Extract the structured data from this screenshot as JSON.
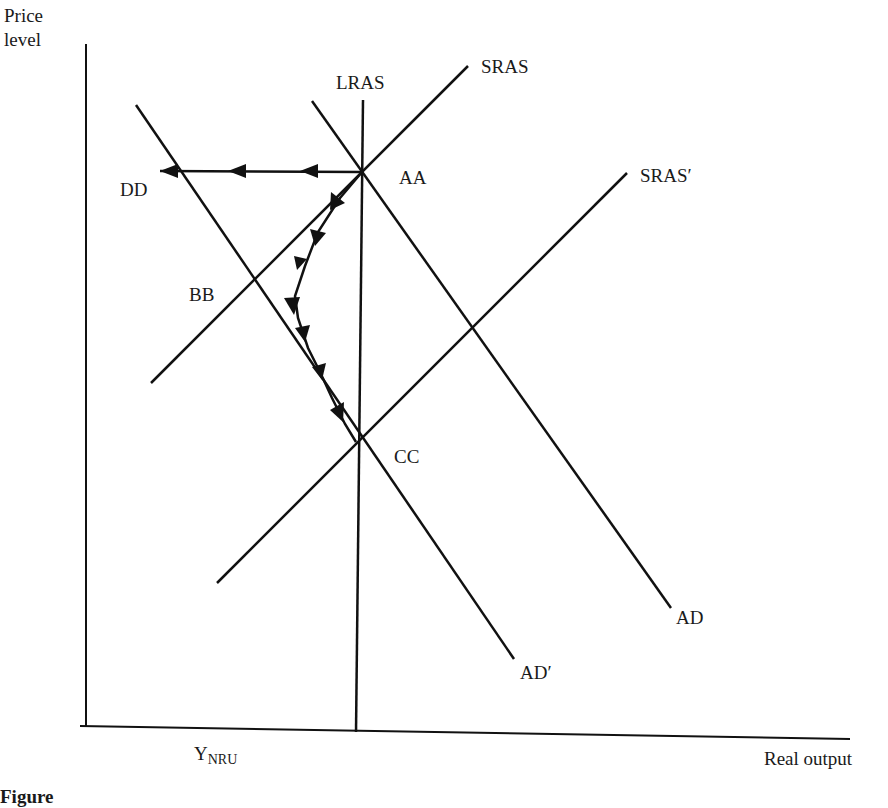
{
  "diagram": {
    "type": "AD-AS macroeconomic diagram",
    "axes": {
      "y_label_line1": "Price",
      "y_label_line2": "level",
      "x_label": "Real output",
      "x_tick_main": "Y",
      "x_tick_sub": "NRU"
    },
    "curves": {
      "lras": "LRAS",
      "sras": "SRAS",
      "sras_prime": "SRAS′",
      "ad": "AD",
      "ad_prime": "AD′"
    },
    "points": {
      "a": "AA",
      "b": "BB",
      "c": "CC",
      "d": "DD"
    },
    "paths": [
      {
        "name": "AA to DD",
        "direction": "left, horizontal",
        "arrows": 3
      },
      {
        "name": "AA to CC",
        "direction": "curved path via near BB",
        "arrows": 6
      }
    ],
    "caption_partial": "Figure"
  },
  "colors": {
    "line": "#111111",
    "text": "#1a1a1a",
    "background": "#ffffff"
  }
}
